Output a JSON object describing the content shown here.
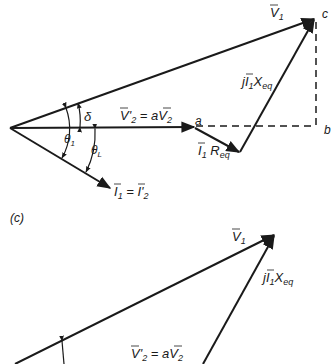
{
  "figure_b": {
    "v1": "V",
    "v1_sub": "1",
    "point_c": "c",
    "point_a": "a",
    "point_b": "b",
    "delta": "δ",
    "theta1": "θ",
    "theta1_sub": "1",
    "thetaL": "θ",
    "thetaL_sub": "L",
    "v2_prime_lhs": "V'",
    "v2_prime_lhs_sub": "2",
    "v2_eq": " = a",
    "v2_rhs": "V",
    "v2_rhs_sub": "2",
    "jx_prefix": "j",
    "jx_I": "I",
    "jx_I_sub": "1",
    "jx_X": "X",
    "jx_X_sub": "eq",
    "r_I": "I",
    "r_I_sub": "1",
    "r_R": " R",
    "r_R_sub": "eq",
    "i_lhs": "I",
    "i_lhs_sub": "1",
    "i_eq": " = ",
    "i_rhs": "I'",
    "i_rhs_sub": "2"
  },
  "figure_c": {
    "panel_label": "(c)",
    "v1": "V",
    "v1_sub": "1",
    "jx_prefix": "j",
    "jx_I": "I",
    "jx_I_sub": "1",
    "jx_X": "X",
    "jx_X_sub": "eq",
    "v2_prime_lhs": "V'",
    "v2_prime_lhs_sub": "2",
    "v2_eq": " = a",
    "v2_rhs": "V",
    "v2_rhs_sub": "2"
  }
}
